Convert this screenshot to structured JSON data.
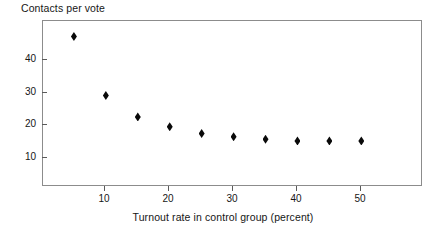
{
  "chart_data": {
    "type": "scatter",
    "title": "",
    "ylabel": "Contacts per vote",
    "xlabel": "Turnout rate in control group (percent)",
    "x": [
      5,
      10,
      15,
      20,
      25,
      30,
      35,
      40,
      45,
      50
    ],
    "values": [
      46,
      28,
      21.5,
      18.5,
      16.5,
      15.5,
      14.7,
      14.2,
      14.2,
      14.2
    ],
    "series": [
      {
        "name": "Contacts per vote",
        "x": [
          5,
          10,
          15,
          20,
          25,
          30,
          35,
          40,
          45,
          50
        ],
        "values": [
          46,
          28,
          21.5,
          18.5,
          16.5,
          15.5,
          14.7,
          14.2,
          14.2,
          14.2
        ]
      }
    ],
    "xticks": [
      10,
      20,
      30,
      40,
      50
    ],
    "xtick_labels": [
      "10",
      "20",
      "30",
      "40",
      "50"
    ],
    "yticks": [
      10,
      20,
      30,
      40
    ],
    "ytick_labels": [
      "10",
      "20",
      "30",
      "40"
    ],
    "xlim": [
      0,
      59.5
    ],
    "ylim": [
      0.5,
      51
    ],
    "grid": false,
    "legend": null,
    "marker": "diamond",
    "marker_color": "#0a0a0a",
    "frame_color": "#8c8c8c"
  },
  "axes": {
    "y_title": "Contacts per vote",
    "x_title": "Turnout rate in control group (percent)",
    "y_tick_labels": [
      "40",
      "30",
      "20",
      "10"
    ],
    "x_tick_labels": [
      "10",
      "20",
      "30",
      "40",
      "50"
    ]
  }
}
